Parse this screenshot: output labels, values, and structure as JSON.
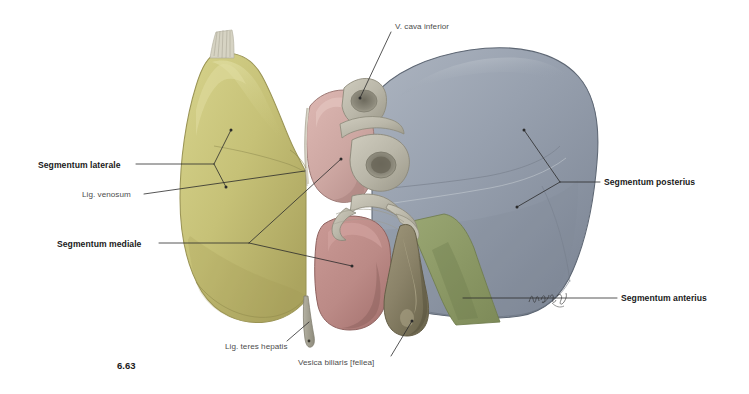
{
  "figure": {
    "number": "6.63",
    "view": "Liver, visceral surface — hepatic segments",
    "signature": "H. Bruchey"
  },
  "labels": {
    "segmentum_laterale": "Segmentum laterale",
    "lig_venosum": "Lig. venosum",
    "segmentum_mediale": "Segmentum mediale",
    "segmentum_posterius": "Segmentum posterius",
    "segmentum_anterius": "Segmentum anterius",
    "vena_cava_inferior": "V. cava inferior",
    "lig_teres_hepatis": "Lig. teres hepatis",
    "vesica_biliaris": "Vesica biliaris [fellea]"
  },
  "colors": {
    "background": "#ffffff",
    "left_lobe": "#c9c579",
    "left_lobe_shade": "#b5b067",
    "caudate_lobe": "#cfa8a4",
    "quadrate_lobe": "#bd8985",
    "right_lobe": "#9aa3b0",
    "right_lobe_shade": "#848d9c",
    "gallbladder": "#8a8268",
    "green_wedge": "#8d9a65",
    "vessel": "#b9b6a8",
    "leader_line": "#2b2b2b",
    "label_bold": "#1a1a1a",
    "label_plain": "#4d4d4d"
  }
}
